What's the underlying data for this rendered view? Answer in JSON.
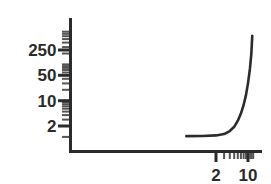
{
  "chart_data": {
    "type": "line",
    "title": "",
    "xlabel": "",
    "ylabel": "",
    "xscale": "log",
    "yscale": "log",
    "grid": false,
    "legend": null,
    "xlim": [
      0.3,
      14
    ],
    "ylim": [
      0.8,
      900
    ],
    "x_tick_labels": [
      {
        "value": 2,
        "label": "2"
      },
      {
        "value": 10,
        "label": "10"
      }
    ],
    "y_tick_labels": [
      {
        "value": 2,
        "label": "2"
      },
      {
        "value": 10,
        "label": "10"
      },
      {
        "value": 50,
        "label": "50"
      },
      {
        "value": 250,
        "label": "250"
      }
    ],
    "x_minor_ticks": [
      2,
      3,
      4,
      5,
      6,
      7,
      8,
      9,
      10,
      11,
      12,
      13
    ],
    "y_minor_ticks": [
      1,
      2,
      3,
      4,
      5,
      6,
      7,
      8,
      9,
      10,
      20,
      30,
      40,
      50,
      60,
      70,
      80,
      90,
      100,
      200,
      250,
      300,
      400,
      500,
      600,
      700,
      800
    ],
    "series": [
      {
        "name": "curve",
        "color": "#2b2b2b",
        "x": [
          0.45,
          1.0,
          2.0,
          3.0,
          4.0,
          5.0,
          6.0,
          7.0,
          8.0,
          9.0,
          10.0,
          11.0,
          11.8,
          12.4
        ],
        "y": [
          1.05,
          1.06,
          1.1,
          1.2,
          1.45,
          1.9,
          2.8,
          4.4,
          7.5,
          14.0,
          30.0,
          75.0,
          190.0,
          620.0
        ]
      }
    ]
  },
  "axes": {
    "axis_color": "#2b2b2b",
    "tick_color": "#555555",
    "label_color": "#2b2b2b"
  }
}
